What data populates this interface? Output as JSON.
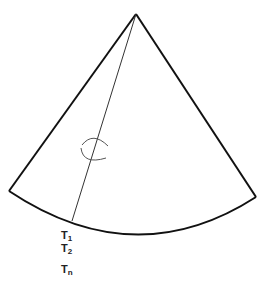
{
  "diagram": {
    "type": "circular-sector",
    "colors": {
      "outline": "#111111",
      "radial_line": "#333333",
      "angle_marker": "#555555",
      "background": "#ffffff"
    },
    "apex": [
      136,
      14
    ],
    "left_corner": [
      9,
      191
    ],
    "right_corner": [
      256,
      197
    ],
    "arc_bottom": [
      140,
      234
    ],
    "radial_line_end": [
      72,
      221
    ],
    "angle_marker_center": [
      96,
      150
    ]
  },
  "labels": [
    {
      "id": "t1",
      "base": "T",
      "sub": "1"
    },
    {
      "id": "t2",
      "base": "T",
      "sub": "2"
    },
    {
      "id": "tn",
      "base": "T",
      "sub": "n"
    }
  ]
}
